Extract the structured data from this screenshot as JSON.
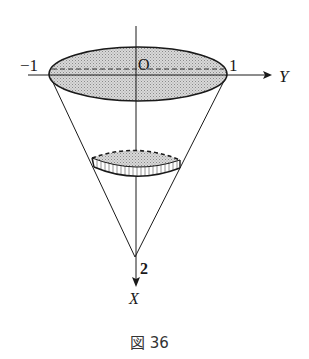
{
  "diagram": {
    "type": "cone-volume-figure",
    "labels": {
      "origin": "O",
      "y_neg": "−1",
      "y_pos": "1",
      "y_axis": "Y",
      "x_tick": "2",
      "x_axis": "X"
    },
    "caption": "図 36",
    "colors": {
      "stroke": "#1a1a1a",
      "fill_shade": "#c8c8c8",
      "background": "#ffffff"
    }
  }
}
